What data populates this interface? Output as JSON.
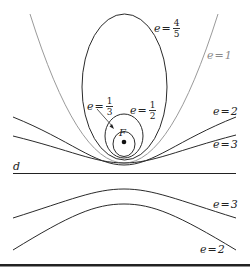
{
  "figure": {
    "focus_label": "F",
    "directrix_label": "d",
    "colors": {
      "curve": "#2a2a2a",
      "parabola": "#9a9a9a",
      "rule": "#222222"
    },
    "labels": {
      "e45": {
        "var": "e",
        "eq": "=",
        "num": "4",
        "den": "5"
      },
      "e1": {
        "var": "e",
        "eq": "=",
        "val": "1"
      },
      "e13": {
        "var": "e",
        "eq": "=",
        "num": "1",
        "den": "3"
      },
      "e12": {
        "var": "e",
        "eq": "=",
        "num": "1",
        "den": "2"
      },
      "e2_upper": {
        "var": "e",
        "eq": "=",
        "val": "2"
      },
      "e3_upper": {
        "var": "e",
        "eq": "=",
        "val": "3"
      },
      "e3_lower": {
        "var": "e",
        "eq": "=",
        "val": "3"
      },
      "e2_lower": {
        "var": "e",
        "eq": "=",
        "val": "2"
      }
    },
    "curves": [
      {
        "name": "ellipse",
        "e": "1/3"
      },
      {
        "name": "ellipse",
        "e": "1/2"
      },
      {
        "name": "ellipse",
        "e": "4/5"
      },
      {
        "name": "parabola",
        "e": "1"
      },
      {
        "name": "hyperbola",
        "e": "2"
      },
      {
        "name": "hyperbola",
        "e": "3"
      }
    ]
  }
}
